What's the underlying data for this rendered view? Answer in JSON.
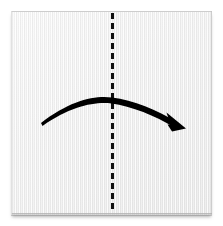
{
  "figure": {
    "title": "Origami fold step",
    "description": "Square sheet of paper with a vertical dashed valley-fold line down the center and a curved arrow showing the left half folding over to the right.",
    "background_color": "#ffffff",
    "canvas": {
      "width": 223,
      "height": 226
    }
  },
  "paper": {
    "label": "paper sheet",
    "shape": "square",
    "fill_color": "#ededed",
    "edge_color": "#c8c8c8",
    "shadow_color": "#a8a8a8",
    "texture": "vertical laid lines",
    "bounds": {
      "x": 11,
      "y": 11,
      "width": 201,
      "height": 204
    }
  },
  "fold_line": {
    "label": "center fold line",
    "style": "dashed",
    "orientation": "vertical",
    "color": "#111111",
    "stroke_width": 3,
    "dash_length": 6,
    "dash_gap": 4,
    "x": 112.5,
    "y_start": 13,
    "y_end": 213
  },
  "fold_arrow": {
    "label": "fold direction arrow",
    "direction": "left to right",
    "color": "#000000",
    "stroke_width": 4,
    "start": {
      "x": 41,
      "y": 123
    },
    "apex": {
      "x": 112,
      "y": 98
    },
    "end": {
      "x": 183,
      "y": 124
    },
    "arrowhead": "solid triangle"
  },
  "annotations": {
    "fold_line_caption": "valley fold",
    "arrow_caption": "fold in half"
  }
}
